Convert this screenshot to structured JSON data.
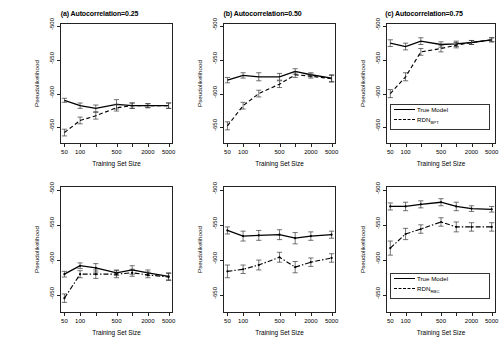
{
  "figure": {
    "axis_labels": {
      "x": "Training Set Size",
      "y": "Pseudolikelihood"
    },
    "x_ticks_labeled": [
      "50",
      "100",
      "500",
      "2000",
      "5000"
    ],
    "y_ticks_labeled": [
      "-500",
      "-550",
      "-600",
      "-650"
    ],
    "legend_top": {
      "series1": "True Model",
      "series2_base": "RDN",
      "series2_sub": "BPT"
    },
    "legend_bottom": {
      "series1": "True Model",
      "series2_base": "RDN",
      "series2_sub": "RBC"
    }
  },
  "chart_data": [
    {
      "type": "line",
      "panel": "top-left",
      "title": "(a) Autocorrelation=0.25",
      "xlabel": "Training Set Size",
      "ylabel": "Pseudolikelihood",
      "xscale": "log",
      "x": [
        50,
        100,
        200,
        500,
        1000,
        2000,
        5000
      ],
      "xtick_values": [
        50,
        100,
        200,
        500,
        1000,
        2000,
        5000
      ],
      "xtick_labels": [
        "50",
        "100",
        "",
        "500",
        "",
        "2000",
        "5000"
      ],
      "ylim": [
        -675,
        -495
      ],
      "ytick_values": [
        -500,
        -550,
        -600,
        -650
      ],
      "grid": false,
      "series": [
        {
          "name": "True Model",
          "style": "solid",
          "values": [
            -610,
            -618,
            -622,
            -616,
            -618,
            -618,
            -618
          ],
          "errors": [
            3,
            4,
            5,
            7,
            4,
            3,
            4
          ]
        },
        {
          "name": "RDN_BPT",
          "style": "dashed",
          "values": [
            -658,
            -640,
            -633,
            -621,
            -618,
            -618,
            -618
          ],
          "errors": [
            5,
            5,
            5,
            5,
            4,
            3,
            4
          ]
        }
      ]
    },
    {
      "type": "line",
      "panel": "top-middle",
      "title": "(b) Autocorrelation=0.50",
      "xlabel": "Training Set Size",
      "ylabel": "Pseudolikelihood",
      "xscale": "log",
      "x": [
        50,
        100,
        200,
        500,
        1000,
        2000,
        5000
      ],
      "xtick_values": [
        50,
        100,
        200,
        500,
        1000,
        2000,
        5000
      ],
      "xtick_labels": [
        "50",
        "100",
        "",
        "500",
        "",
        "2000",
        "5000"
      ],
      "ylim": [
        -675,
        -495
      ],
      "ytick_values": [
        -500,
        -550,
        -600,
        -650
      ],
      "grid": false,
      "series": [
        {
          "name": "True Model",
          "style": "solid",
          "values": [
            -580,
            -573,
            -575,
            -575,
            -567,
            -572,
            -577
          ],
          "errors": [
            4,
            4,
            6,
            5,
            4,
            3,
            5
          ]
        },
        {
          "name": "RDN_BPT",
          "style": "dashed",
          "values": [
            -648,
            -618,
            -600,
            -586,
            -572,
            -574,
            -578
          ],
          "errors": [
            6,
            5,
            5,
            5,
            4,
            3,
            5
          ]
        }
      ]
    },
    {
      "type": "line",
      "panel": "top-right",
      "title": "(c) Autocorrelation=0.75",
      "xlabel": "Training Set Size",
      "ylabel": "Pseudolikelihood",
      "xscale": "log",
      "x": [
        50,
        100,
        200,
        500,
        1000,
        2000,
        5000
      ],
      "xtick_values": [
        50,
        100,
        200,
        500,
        1000,
        2000,
        5000
      ],
      "xtick_labels": [
        "50",
        "100",
        "",
        "500",
        "",
        "2000",
        "5000"
      ],
      "ylim": [
        -675,
        -495
      ],
      "ytick_values": [
        -500,
        -550,
        -600,
        -650
      ],
      "grid": false,
      "series": [
        {
          "name": "True Model",
          "style": "solid",
          "values": [
            -525,
            -530,
            -522,
            -527,
            -526,
            -524,
            -520
          ],
          "errors": [
            5,
            5,
            5,
            4,
            4,
            3,
            3
          ]
        },
        {
          "name": "RDN_BPT",
          "style": "dashed",
          "values": [
            -600,
            -575,
            -538,
            -533,
            -528,
            -524,
            -520
          ],
          "errors": [
            6,
            6,
            5,
            5,
            4,
            3,
            3
          ]
        }
      ]
    },
    {
      "type": "line",
      "panel": "bottom-left",
      "title": "",
      "xlabel": "Training Set Size",
      "ylabel": "Pseudolikelihood",
      "xscale": "log",
      "x": [
        50,
        100,
        200,
        500,
        1000,
        2000,
        5000
      ],
      "xtick_values": [
        50,
        100,
        200,
        500,
        1000,
        2000,
        5000
      ],
      "xtick_labels": [
        "50",
        "100",
        "",
        "500",
        "",
        "2000",
        "5000"
      ],
      "ylim": [
        -675,
        -495
      ],
      "ytick_values": [
        -500,
        -550,
        -600,
        -650
      ],
      "grid": false,
      "series": [
        {
          "name": "True Model",
          "style": "solid",
          "values": [
            -620,
            -608,
            -611,
            -618,
            -614,
            -618,
            -623
          ],
          "errors": [
            4,
            4,
            6,
            4,
            6,
            4,
            5
          ]
        },
        {
          "name": "RDN_RBC",
          "style": "dashdot",
          "values": [
            -654,
            -620,
            -620,
            -620,
            -618,
            -621,
            -624
          ],
          "errors": [
            6,
            5,
            6,
            5,
            5,
            4,
            5
          ]
        }
      ]
    },
    {
      "type": "line",
      "panel": "bottom-middle",
      "title": "",
      "xlabel": "Training Set Size",
      "ylabel": "Pseudolikelihood",
      "xscale": "log",
      "x": [
        50,
        100,
        200,
        500,
        1000,
        2000,
        5000
      ],
      "xtick_values": [
        50,
        100,
        200,
        500,
        1000,
        2000,
        5000
      ],
      "xtick_labels": [
        "50",
        "100",
        "",
        "500",
        "",
        "2000",
        "5000"
      ],
      "ylim": [
        -675,
        -495
      ],
      "ytick_values": [
        -500,
        -550,
        -600,
        -650
      ],
      "grid": false,
      "series": [
        {
          "name": "True Model",
          "style": "solid",
          "values": [
            -558,
            -566,
            -565,
            -564,
            -569,
            -566,
            -564
          ],
          "errors": [
            5,
            7,
            7,
            7,
            8,
            6,
            5
          ]
        },
        {
          "name": "RDN_RBC",
          "style": "dashdot",
          "values": [
            -616,
            -613,
            -607,
            -596,
            -610,
            -603,
            -597
          ],
          "errors": [
            9,
            6,
            7,
            7,
            8,
            6,
            6
          ]
        }
      ]
    },
    {
      "type": "line",
      "panel": "bottom-right",
      "title": "",
      "xlabel": "Training Set Size",
      "ylabel": "Pseudolikelihood",
      "xscale": "log",
      "x": [
        50,
        100,
        200,
        500,
        1000,
        2000,
        5000
      ],
      "xtick_values": [
        50,
        100,
        200,
        500,
        1000,
        2000,
        5000
      ],
      "xtick_labels": [
        "50",
        "100",
        "",
        "500",
        "",
        "2000",
        "5000"
      ],
      "ylim": [
        -675,
        -495
      ],
      "ytick_values": [
        -500,
        -550,
        -600,
        -650
      ],
      "grid": false,
      "series": [
        {
          "name": "True Model",
          "style": "solid",
          "values": [
            -524,
            -524,
            -521,
            -518,
            -524,
            -527,
            -528
          ],
          "errors": [
            5,
            6,
            5,
            5,
            6,
            4,
            4
          ]
        },
        {
          "name": "RDN_RBC",
          "style": "dashdot",
          "values": [
            -583,
            -563,
            -556,
            -546,
            -553,
            -553,
            -553
          ],
          "errors": [
            10,
            8,
            6,
            6,
            7,
            6,
            6
          ]
        }
      ]
    }
  ]
}
